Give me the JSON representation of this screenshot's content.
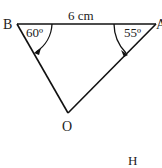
{
  "diagram": {
    "type": "triangle",
    "vertices": {
      "B": {
        "label": "B"
      },
      "A": {
        "label": "A"
      },
      "O": {
        "label": "O"
      }
    },
    "side_label": "6 cm",
    "angle_B": "60º",
    "angle_A": "55º",
    "extra_label": "H",
    "stroke_color": "#111111"
  }
}
